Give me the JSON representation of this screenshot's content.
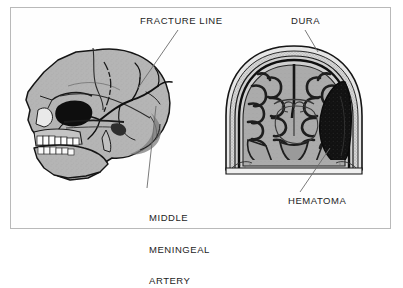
{
  "figure": {
    "type": "medical-illustration",
    "background_color": "#ffffff",
    "frame_color": "#b9b9b9",
    "panels": [
      {
        "name": "lateral-skull",
        "description": "Lateral view of human skull showing temporal fracture line crossing the groove of the middle meningeal artery",
        "bone_color": "#b3b3b3",
        "outline_color": "#1a1a1a"
      },
      {
        "name": "coronal-head-section",
        "description": "Coronal section of head showing brain gyri, ventricles, dura and a dark epidural hematoma compressing the right hemisphere",
        "brain_color": "#aeaeae",
        "hematoma_color": "#141414",
        "skull_color": "#d8d8d8"
      }
    ],
    "labels": [
      {
        "id": "fracture-line",
        "text": "FRACTURE LINE",
        "lines": [
          "FRACTURE LINE"
        ]
      },
      {
        "id": "dura",
        "text": "DURA",
        "lines": [
          "DURA"
        ]
      },
      {
        "id": "middle-meningeal-artery",
        "text": "MIDDLE MENINGEAL ARTERY",
        "lines": [
          "MIDDLE",
          "MENINGEAL",
          "ARTERY"
        ]
      },
      {
        "id": "hematoma",
        "text": "HEMATOMA",
        "lines": [
          "HEMATOMA"
        ]
      }
    ],
    "label_text": {
      "fracture": "FRACTURE LINE",
      "dura": "DURA",
      "artery_line1": "MIDDLE",
      "artery_line2": "MENINGEAL",
      "artery_line3": "ARTERY",
      "hematoma": "HEMATOMA"
    },
    "leader_lines": [
      {
        "from": "fracture-line",
        "to": "skull-temporal-fracture"
      },
      {
        "from": "dura",
        "to": "inner-skull-dura-layer"
      },
      {
        "from": "middle-meningeal-artery",
        "to": "skull-artery-groove"
      },
      {
        "from": "hematoma",
        "to": "epidural-blood-collection"
      }
    ],
    "caption_fragment": ""
  }
}
